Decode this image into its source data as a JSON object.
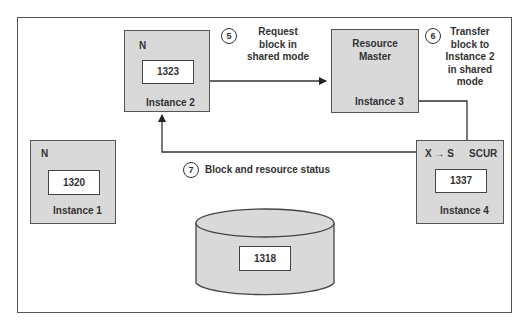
{
  "instances": [
    {
      "id": "instance-1",
      "label": "Instance 1",
      "mode": "N",
      "block": "1320"
    },
    {
      "id": "instance-2",
      "label": "Instance 2",
      "mode": "N",
      "block": "1323"
    },
    {
      "id": "instance-3",
      "label": "Instance 3",
      "title_line1": "Resource",
      "title_line2": "Master"
    },
    {
      "id": "instance-4",
      "label": "Instance 4",
      "mode": "X → S",
      "status": "SCUR",
      "block": "1337"
    }
  ],
  "disk": {
    "block": "1318"
  },
  "steps": [
    {
      "num": "5",
      "lines": [
        "Request",
        "block in",
        "shared mode"
      ]
    },
    {
      "num": "6",
      "lines": [
        "Transfer",
        "block to",
        "Instance 2",
        "in shared",
        "mode"
      ]
    },
    {
      "num": "7",
      "text": "Block and resource status"
    }
  ],
  "colors": {
    "box_fill": "#d9d9d9",
    "stroke": "#444444"
  }
}
